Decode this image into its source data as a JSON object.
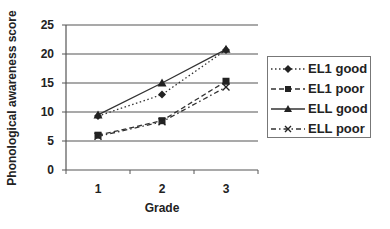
{
  "chart_data": {
    "type": "line",
    "title": "",
    "xlabel": "Grade",
    "ylabel": "Phonological awareness score",
    "categories": [
      "1",
      "2",
      "3"
    ],
    "ylim": [
      0,
      25
    ],
    "yticks": [
      "0",
      "5",
      "10",
      "15",
      "20",
      "25"
    ],
    "grid": "horizontal",
    "legend_position": "right",
    "series": [
      {
        "name": "EL1 good",
        "values": [
          9.3,
          13.0,
          20.7
        ],
        "marker": "diamond",
        "line": "dotted"
      },
      {
        "name": "EL1 poor",
        "values": [
          6.0,
          8.5,
          15.3
        ],
        "marker": "square",
        "line": "dashed"
      },
      {
        "name": "ELL good",
        "values": [
          9.5,
          15.0,
          20.8
        ],
        "marker": "triangle",
        "line": "solid"
      },
      {
        "name": "ELL poor",
        "values": [
          5.8,
          8.3,
          14.3
        ],
        "marker": "x",
        "line": "dashdot"
      }
    ]
  },
  "colors": {
    "line": "#333333",
    "grid": "#555555",
    "text": "#222222"
  }
}
